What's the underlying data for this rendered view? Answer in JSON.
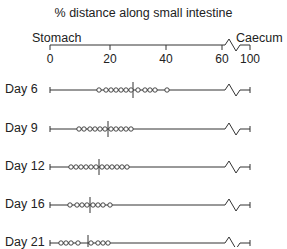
{
  "title": "% distance along small intestine",
  "axis": {
    "left_label": "Stomach",
    "right_label": "Caecum",
    "ticks": [
      {
        "label": "0",
        "x": 50
      },
      {
        "label": "20",
        "x": 110
      },
      {
        "label": "40",
        "x": 166
      },
      {
        "label": "60",
        "x": 222
      },
      {
        "label": "100",
        "x": 250
      }
    ]
  },
  "rows": [
    {
      "label": "Day 6",
      "y": 90,
      "divider_x": 133,
      "markers": [
        99,
        106,
        111,
        116,
        121,
        126,
        131,
        138,
        145,
        150,
        155,
        167
      ]
    },
    {
      "label": "Day 9",
      "y": 129,
      "divider_x": 108,
      "markers": [
        79,
        84,
        90,
        95,
        100,
        105,
        111,
        116,
        121,
        126,
        131
      ]
    },
    {
      "label": "Day 12",
      "y": 167,
      "divider_x": 99,
      "markers": [
        71,
        76,
        81,
        86,
        91,
        96,
        102,
        107,
        112,
        117,
        122,
        127
      ]
    },
    {
      "label": "Day 16",
      "y": 205,
      "divider_x": 90,
      "markers": [
        70,
        77,
        82,
        87,
        93,
        98,
        103,
        110
      ]
    },
    {
      "label": "Day 21",
      "y": 243,
      "divider_x": 88,
      "markers": [
        61,
        66,
        71,
        78,
        91,
        98,
        103,
        108
      ]
    }
  ],
  "chart_data": {
    "type": "scatter",
    "title": "% distance along small intestine",
    "xlabel": "% distance along small intestine (Stomach → Caecum)",
    "x_ticks": [
      "0",
      "20",
      "40",
      "60",
      "100"
    ],
    "series": [
      {
        "name": "Day 6",
        "values": [
          17,
          20,
          22,
          24,
          26,
          28,
          30,
          33,
          35,
          37,
          39,
          43
        ],
        "median": 29
      },
      {
        "name": "Day 9",
        "values": [
          10,
          12,
          14,
          16,
          18,
          20,
          22,
          24,
          26,
          28,
          30
        ],
        "median": 20
      },
      {
        "name": "Day 12",
        "values": [
          7,
          9,
          11,
          13,
          15,
          17,
          19,
          21,
          23,
          25,
          27,
          29
        ],
        "median": 17
      },
      {
        "name": "Day 16",
        "values": [
          7,
          9,
          11,
          13,
          15,
          17,
          19,
          21
        ],
        "median": 14
      },
      {
        "name": "Day 21",
        "values": [
          4,
          5,
          7,
          10,
          14,
          17,
          19,
          21
        ],
        "median": 13
      }
    ]
  }
}
